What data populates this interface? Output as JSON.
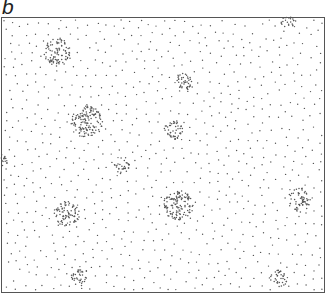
{
  "figure": {
    "panel_label": "b",
    "width": 330,
    "height": 297,
    "frame": {
      "x": 1,
      "y": 17,
      "w": 324,
      "h": 276,
      "stroke": "#555555"
    },
    "dot_color": "#555555",
    "background_dots": {
      "count": 900,
      "radius": 0.7,
      "min_spacing": 7.5,
      "seed": 7
    },
    "clusters": [
      {
        "name": "cluster-top-left",
        "cx": 58,
        "cy": 52,
        "r": 14,
        "n": 90
      },
      {
        "name": "cluster-left-large",
        "cx": 87,
        "cy": 122,
        "r": 16,
        "n": 130
      },
      {
        "name": "cluster-upper-center",
        "cx": 185,
        "cy": 82,
        "r": 9,
        "n": 40
      },
      {
        "name": "cluster-center",
        "cx": 173,
        "cy": 130,
        "r": 10,
        "n": 45
      },
      {
        "name": "cluster-center-left-small",
        "cx": 122,
        "cy": 166,
        "r": 8,
        "n": 30
      },
      {
        "name": "cluster-center-large",
        "cx": 178,
        "cy": 205,
        "r": 15,
        "n": 120
      },
      {
        "name": "cluster-lower-left",
        "cx": 67,
        "cy": 213,
        "r": 13,
        "n": 80
      },
      {
        "name": "cluster-right",
        "cx": 300,
        "cy": 200,
        "r": 12,
        "n": 60
      },
      {
        "name": "cluster-bottom-left",
        "cx": 80,
        "cy": 277,
        "r": 9,
        "n": 35
      },
      {
        "name": "cluster-bottom-right",
        "cx": 278,
        "cy": 279,
        "r": 9,
        "n": 35
      },
      {
        "name": "cluster-top-edge",
        "cx": 289,
        "cy": 21,
        "r": 8,
        "n": 25
      },
      {
        "name": "cluster-left-edge",
        "cx": 2,
        "cy": 160,
        "r": 6,
        "n": 16
      }
    ]
  }
}
